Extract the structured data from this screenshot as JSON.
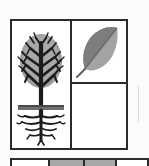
{
  "document": {
    "type": "scanned-figure",
    "title": "Botanical icon grid",
    "caption": ""
  },
  "palette": {
    "ink": "#2b2b2b",
    "paper": "#fcfbfa",
    "canopy_gray": "#9c9c9c",
    "canopy_gray_light": "#b4b4b4",
    "ground_gray": "#6f6f6f",
    "leaf_dark": "#7d7d7d",
    "leaf_light": "#a3a3a3",
    "swatch_gray": "#a8a8a8",
    "edge_rule": "#d9d9d9"
  },
  "grid": {
    "cells": [
      {
        "id": "tree",
        "label": "Tree with root system",
        "position": "left-full-height",
        "contents": [
          "canopy",
          "trunk",
          "ground-line",
          "roots"
        ]
      },
      {
        "id": "leaf",
        "label": "Broadleaf",
        "position": "right-top",
        "contents": [
          "leaf-blade",
          "midrib",
          "stem"
        ]
      },
      {
        "id": "blank",
        "label": "Empty panel",
        "position": "right-bottom",
        "contents": []
      }
    ]
  },
  "swatch_strip": {
    "label": "Partial lower row of cells",
    "cells": [
      {
        "tone": "light"
      },
      {
        "tone": "gray"
      },
      {
        "tone": "gray"
      },
      {
        "tone": "light"
      }
    ]
  }
}
